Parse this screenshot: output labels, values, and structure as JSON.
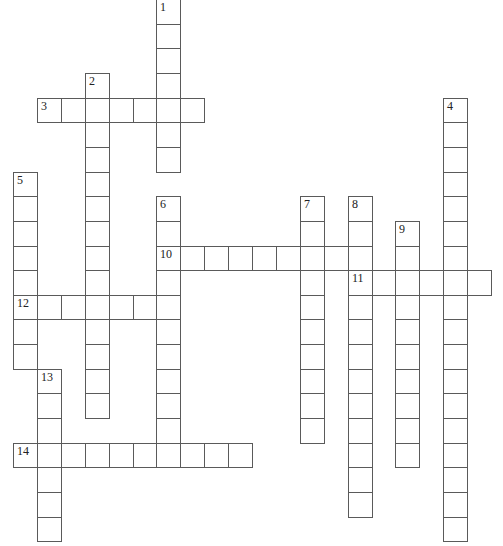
{
  "puzzle": {
    "type": "crossword",
    "grid": {
      "origin_x": 13,
      "origin_y": -1,
      "cell_w": 23.9,
      "cell_h": 24.65,
      "line_color": "#5a5a5a"
    },
    "words": [
      {
        "number": "1",
        "direction": "down",
        "row": 0,
        "col": 6,
        "length": 7
      },
      {
        "number": "2",
        "direction": "down",
        "row": 3,
        "col": 3,
        "length": 14
      },
      {
        "number": "3",
        "direction": "across",
        "row": 4,
        "col": 1,
        "length": 7
      },
      {
        "number": "4",
        "direction": "down",
        "row": 4,
        "col": 18,
        "length": 18
      },
      {
        "number": "5",
        "direction": "down",
        "row": 7,
        "col": 0,
        "length": 8
      },
      {
        "number": "6",
        "direction": "down",
        "row": 8,
        "col": 6,
        "length": 11
      },
      {
        "number": "7",
        "direction": "down",
        "row": 8,
        "col": 12,
        "length": 10
      },
      {
        "number": "8",
        "direction": "down",
        "row": 8,
        "col": 14,
        "length": 13
      },
      {
        "number": "9",
        "direction": "down",
        "row": 9,
        "col": 16,
        "length": 10
      },
      {
        "number": "10",
        "direction": "across",
        "row": 10,
        "col": 6,
        "length": 9
      },
      {
        "number": "11",
        "direction": "across",
        "row": 11,
        "col": 14,
        "length": 6
      },
      {
        "number": "12",
        "direction": "across",
        "row": 12,
        "col": 0,
        "length": 7
      },
      {
        "number": "13",
        "direction": "down",
        "row": 15,
        "col": 1,
        "length": 7
      },
      {
        "number": "14",
        "direction": "across",
        "row": 18,
        "col": 0,
        "length": 10
      }
    ]
  }
}
